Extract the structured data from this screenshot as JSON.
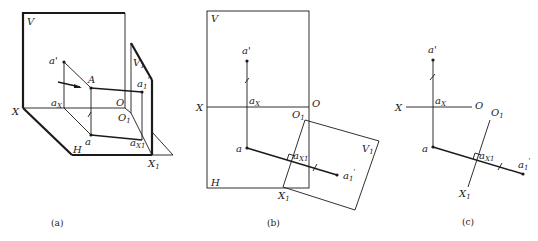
{
  "figure": {
    "panels": [
      {
        "id": "a",
        "caption": "(a)",
        "labels": {
          "V": "V",
          "V1": "V",
          "V1_sub": "1",
          "a_prime": "a'",
          "A": "A",
          "a1_prime": "a",
          "a1_prime_sub": "1",
          "a1_prime_sup": "'",
          "X": "X",
          "aX": "a",
          "aX_sub": "X",
          "O": "O",
          "O1": "O",
          "O1_sub": "1",
          "a": "a",
          "aX1": "a",
          "aX1_sub": "X1",
          "H": "H",
          "X1": "X",
          "X1_sub": "1"
        }
      },
      {
        "id": "b",
        "caption": "(b)",
        "labels": {
          "V": "V",
          "a_prime": "a'",
          "X": "X",
          "aX": "a",
          "aX_sub": "X",
          "O": "O",
          "O1": "O",
          "O1_sub": "1",
          "V1": "V",
          "V1_sub": "1",
          "a": "a",
          "aX1": "a",
          "aX1_sub": "X1",
          "a1_prime": "a",
          "a1_prime_sub": "1",
          "a1_prime_sup": "'",
          "H": "H",
          "X1": "X",
          "X1_sub": "1"
        }
      },
      {
        "id": "c",
        "caption": "(c)",
        "labels": {
          "a_prime": "a'",
          "X": "X",
          "aX": "a",
          "aX_sub": "X",
          "O": "O",
          "O1": "O",
          "O1_sub": "1",
          "a": "a",
          "aX1": "a",
          "aX1_sub": "X1",
          "a1_prime": "a",
          "a1_prime_sub": "1",
          "a1_prime_sup": "'",
          "X1": "X",
          "X1_sub": "1"
        }
      }
    ]
  }
}
